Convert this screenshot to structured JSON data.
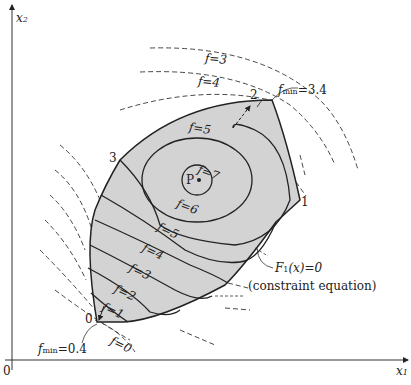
{
  "axes": {
    "x_label": "x",
    "x_sub": "1",
    "y_label": "x",
    "y_sub": "2",
    "origin": "0"
  },
  "vertices": {
    "v0": "0",
    "v1": "1",
    "v2": "2",
    "v3": "3",
    "center": "P"
  },
  "contours_inside": {
    "f7": "f=7",
    "f6": "f=6",
    "f5a": "f=5",
    "f5b": "f=5",
    "f4": "f=4",
    "f3": "f=3",
    "f2": "f=2",
    "f1": "f=1"
  },
  "contours_outside": {
    "f3": "f=3",
    "f4": "f=4",
    "f0": "f=0"
  },
  "annotations": {
    "fmin_top_f": "f",
    "fmin_top_sub": "min",
    "fmin_top_val": "=3.4",
    "fmin_bottom_f": "f",
    "fmin_bottom_sub": "min",
    "fmin_bottom_val": "=0.4",
    "constraint_label": "F",
    "constraint_sub": "1",
    "constraint_rest": "(x)=0",
    "constraint_desc": "(constraint equation)"
  },
  "colors": {
    "region_fill": "#d3d3d3",
    "line": "#222222"
  }
}
